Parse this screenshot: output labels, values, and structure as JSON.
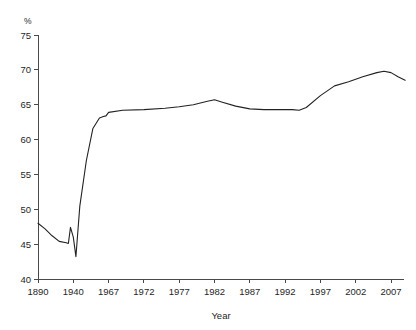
{
  "chart_data": {
    "type": "line",
    "title": "",
    "subtitle": "",
    "xlabel": "Year",
    "ylabel": "",
    "unit_label": "%",
    "grid": false,
    "legend": false,
    "xlim": [
      1890,
      2009
    ],
    "ylim": [
      40,
      75
    ],
    "ytick_labels": [
      "75",
      "70",
      "65",
      "60",
      "55",
      "50",
      "45",
      "40"
    ],
    "yticks": [
      75,
      70,
      65,
      60,
      55,
      50,
      45,
      40
    ],
    "xtick_labels": [
      "1890",
      "1940",
      "1967",
      "1972",
      "1977",
      "1982",
      "1987",
      "1992",
      "1997",
      "2002",
      "2007"
    ],
    "xticks": [
      1890,
      1940,
      1967,
      1972,
      1977,
      1982,
      1987,
      1992,
      1997,
      2002,
      2007
    ],
    "series": [
      {
        "name": "Rate",
        "x": [
          1890,
          1900,
          1910,
          1920,
          1930,
          1933,
          1936,
          1940,
          1942,
          1945,
          1950,
          1955,
          1960,
          1963,
          1965,
          1967,
          1969,
          1972,
          1975,
          1977,
          1979,
          1981,
          1982,
          1983,
          1985,
          1987,
          1989,
          1991,
          1993,
          1994,
          1995,
          1997,
          1999,
          2001,
          2003,
          2005,
          2006,
          2007,
          2008,
          2009
        ],
        "y": [
          48.0,
          47.2,
          46.2,
          45.4,
          45.2,
          45.1,
          47.4,
          46.0,
          43.2,
          50.5,
          57.0,
          61.6,
          63.1,
          63.3,
          63.4,
          63.9,
          64.2,
          64.3,
          64.5,
          64.7,
          65.0,
          65.5,
          65.7,
          65.4,
          64.8,
          64.4,
          64.3,
          64.3,
          64.3,
          64.2,
          64.6,
          66.3,
          67.7,
          68.3,
          69.0,
          69.6,
          69.8,
          69.6,
          69.0,
          68.5
        ]
      }
    ]
  },
  "axis": {
    "x_title": "Year",
    "y_unit": "%"
  }
}
